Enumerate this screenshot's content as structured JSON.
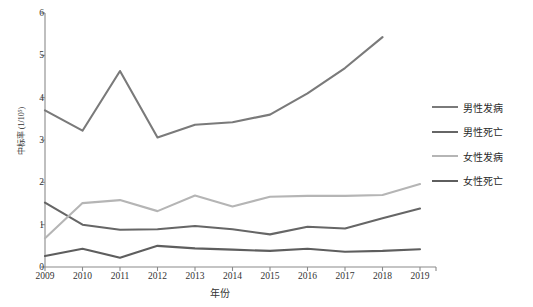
{
  "chart_data": {
    "type": "line",
    "title": "",
    "xlabel": "年份",
    "ylabel": "中标率 (1/10⁵)",
    "x": [
      2009,
      2010,
      2011,
      2012,
      2013,
      2014,
      2015,
      2016,
      2017,
      2018,
      2019
    ],
    "xtick_labels": [
      "2009",
      "2010",
      "2011",
      "2012",
      "2013",
      "2014",
      "2015",
      "2016",
      "2017",
      "2018",
      "2019"
    ],
    "ytick_labels": [
      "0",
      "1",
      "2",
      "3",
      "4",
      "5",
      "6"
    ],
    "yticks": [
      0,
      1,
      2,
      3,
      4,
      5,
      6
    ],
    "ylim": [
      0,
      6
    ],
    "grid": false,
    "legend_position": "right",
    "series": [
      {
        "name": "男性发病",
        "color": "#7a7a7a",
        "values": [
          3.7,
          3.22,
          4.63,
          3.06,
          3.36,
          3.42,
          3.6,
          4.1,
          4.7,
          5.43,
          null
        ]
      },
      {
        "name": "男性死亡",
        "color": "#666666",
        "values": [
          1.52,
          1.0,
          0.88,
          0.89,
          0.97,
          0.89,
          0.77,
          0.95,
          0.91,
          1.15,
          1.38
        ]
      },
      {
        "name": "女性发病",
        "color": "#b5b5b5",
        "values": [
          0.68,
          1.51,
          1.58,
          1.32,
          1.69,
          1.43,
          1.66,
          1.68,
          1.68,
          1.7,
          1.96
        ]
      },
      {
        "name": "女性死亡",
        "color": "#5e5e5e",
        "values": [
          0.26,
          0.43,
          0.22,
          0.5,
          0.44,
          0.41,
          0.38,
          0.43,
          0.36,
          0.38,
          0.42
        ]
      }
    ]
  },
  "axis_color": "#8a8a8a",
  "background": "#ffffff"
}
